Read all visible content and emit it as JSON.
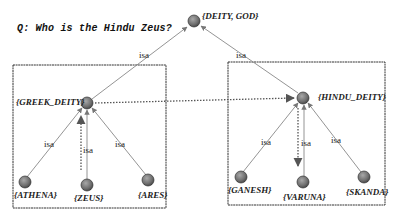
{
  "question": "Q: Who is the Hindu Zeus?",
  "edge_label": "isa",
  "nodes": {
    "root": "{DEITY, GOD}",
    "greek": "{GREEK_DEITY}",
    "hindu": "{HINDU_DEITY}",
    "athena": "{ATHENA}",
    "zeus": "{ZEUS}",
    "ares": "{ARES}",
    "ganesh": "{GANESH}",
    "varuna": "{VARUNA}",
    "skanda": "{SKANDA}"
  },
  "edges": [
    {
      "from": "greek",
      "to": "root",
      "label": "isa"
    },
    {
      "from": "hindu",
      "to": "root",
      "label": "isa"
    },
    {
      "from": "athena",
      "to": "greek",
      "label": "isa"
    },
    {
      "from": "zeus",
      "to": "greek",
      "label": "isa"
    },
    {
      "from": "ares",
      "to": "greek",
      "label": "isa"
    },
    {
      "from": "ganesh",
      "to": "hindu",
      "label": "isa"
    },
    {
      "from": "varuna",
      "to": "hindu",
      "label": "isa"
    },
    {
      "from": "skanda",
      "to": "hindu",
      "label": "isa"
    }
  ],
  "analogy_path": [
    "zeus",
    "greek",
    "hindu",
    "varuna"
  ],
  "colors": {
    "node": "#7a7a7a",
    "edge": "#555555",
    "dotted": "#666666",
    "box": "#333333"
  }
}
